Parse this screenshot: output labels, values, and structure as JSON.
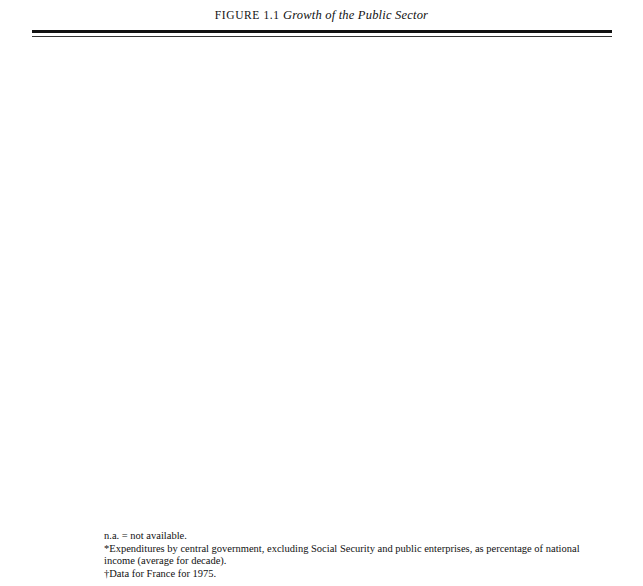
{
  "figure": {
    "number": "FIGURE 1.1",
    "title": "Growth of the Public Sector"
  },
  "axis": {
    "ticks": [
      "0",
      "10",
      "20",
      "30",
      "40",
      "50",
      "60",
      "70",
      "80",
      "90",
      "100"
    ],
    "title": "Percentage of GNP in Public Sector*",
    "min": 0,
    "max": 100
  },
  "notes": {
    "na": "n.a. = not available.",
    "star": "*Expenditures by central government, excluding Social Security and public enterprises, as percentage of national income (average for decade).",
    "dagger": "†Data for France for 1975."
  },
  "colors": {
    "bar_fill": "#d9d9d9",
    "bar_stroke": "#4a4a4a",
    "grid": "#8a8a8a",
    "text": "#111111"
  },
  "chart_data": [
    {
      "type": "bar",
      "orientation": "horizontal",
      "period": "1890-1899",
      "title": "",
      "xlabel": "Percentage of GNP in Public Sector*",
      "ylabel": "",
      "xlim": [
        0,
        100
      ],
      "grid": true,
      "legend": "none",
      "categories": [
        "United States",
        "Russia",
        "China",
        "United Kingdom",
        "France",
        "Germany",
        "Japan",
        "Average (Except Russia and China)"
      ],
      "category_lines": [
        [
          "United",
          "States"
        ],
        [
          "Russia"
        ],
        [
          "China"
        ],
        [
          "United",
          "Kingdom"
        ],
        [
          "France"
        ],
        [
          "Germany"
        ],
        [
          "Japan"
        ],
        [
          "Average",
          "(Except Russia",
          "and China)"
        ]
      ],
      "values": [
        4,
        26,
        null,
        7.5,
        14,
        5.5,
        12.5,
        6.5
      ],
      "annotations": [
        {
          "category": "China",
          "text": "n.a."
        }
      ]
    },
    {
      "type": "bar",
      "orientation": "horizontal",
      "period": "1920-1929",
      "title": "",
      "xlabel": "Percentage of GNP in Public Sector*",
      "ylabel": "",
      "xlim": [
        0,
        100
      ],
      "grid": true,
      "legend": "none",
      "categories": [
        "United States",
        "Soviet Union",
        "China",
        "United Kingdom",
        "France",
        "Germany",
        "Japan",
        "Average (Except USSR and China)"
      ],
      "category_lines": [
        [
          "United",
          "States"
        ],
        [
          "Soviet",
          "Union"
        ],
        [
          "China"
        ],
        [
          "United",
          "Kingdom"
        ],
        [
          "France"
        ],
        [
          "Germany"
        ],
        [
          "Japan"
        ],
        [
          "Average",
          "(Except USSR",
          "and China)"
        ]
      ],
      "values": [
        3.5,
        35,
        1.5,
        24.5,
        20,
        16,
        14.5,
        16.5
      ],
      "annotations": []
    },
    {
      "type": "bar",
      "orientation": "horizontal",
      "period": "1950-1959",
      "title": "",
      "xlabel": "Percentage of GNP in Public Sector*",
      "ylabel": "",
      "xlim": [
        0,
        100
      ],
      "grid": true,
      "legend": "none",
      "categories": [
        "United States",
        "Soviet Union",
        "China (PR)",
        "United Kingdom",
        "France",
        "Germany (GFR)",
        "Japan",
        "Average (Except USSR and China)"
      ],
      "category_lines": [
        [
          "United",
          "States"
        ],
        [
          "Soviet",
          "Union"
        ],
        [
          "China (PR)"
        ],
        [
          "United",
          "Kingdom"
        ],
        [
          "France"
        ],
        [
          "Germany",
          "(GFR)"
        ],
        [
          "Japan"
        ],
        [
          "Average",
          "(Except USSR",
          "and China)"
        ]
      ],
      "values": [
        18,
        50,
        32,
        24,
        26.5,
        16,
        14,
        20
      ],
      "annotations": []
    },
    {
      "type": "bar",
      "orientation": "horizontal",
      "period": "1976",
      "title": "",
      "xlabel": "Percentage of GNP in Public Sector*",
      "ylabel": "",
      "xlim": [
        0,
        100
      ],
      "grid": true,
      "legend": "none",
      "categories": [
        "United States",
        "Soviet Union",
        "China",
        "United Kingdom",
        "France†",
        "Germany (GFR)",
        "Japan",
        "Average"
      ],
      "category_lines": [
        [
          "United",
          "States"
        ],
        [
          "Soviet",
          "Union"
        ],
        [
          "China"
        ],
        [
          "United",
          "Kingdom"
        ],
        [
          "France†"
        ],
        [
          "Germany",
          "(GFR)"
        ],
        [
          "Japan"
        ],
        [
          "Average"
        ]
      ],
      "values": [
        34,
        58,
        null,
        47,
        42,
        47.5,
        16,
        null
      ],
      "annotations": [
        {
          "category": "China",
          "text": "n.a."
        },
        {
          "category": "Average",
          "text": "n.a."
        }
      ]
    }
  ]
}
